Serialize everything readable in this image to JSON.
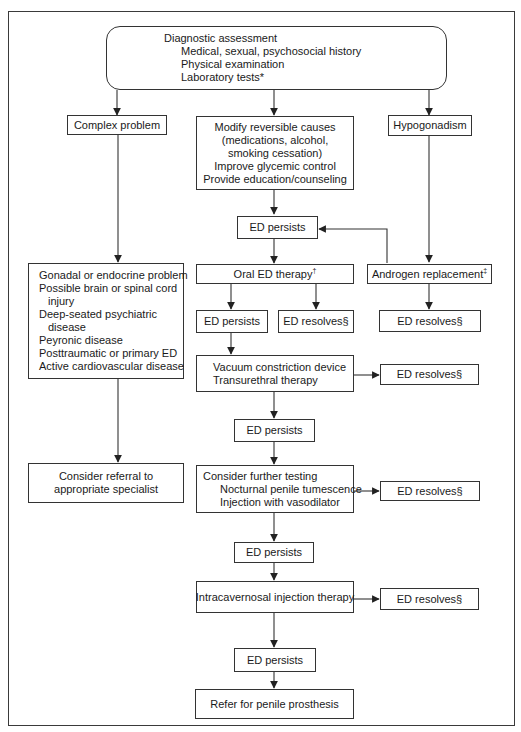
{
  "diagram": {
    "start": {
      "title": "Diagnostic assessment",
      "items": [
        "Medical, sexual, psychosocial history",
        "Physical examination",
        "Laboratory tests*"
      ]
    },
    "complex_problem": "Complex problem",
    "modify_causes": {
      "lines": [
        "Modify reversible causes",
        "(medications, alcohol,",
        "smoking cessation)",
        "Improve glycemic control",
        "Provide education/counseling"
      ]
    },
    "hypogonadism": "Hypogonadism",
    "ed_persists_1": "ED persists",
    "oral_therapy": {
      "label": "Oral ED therapy",
      "mark": "†"
    },
    "androgen": {
      "label": "Androgen replacement",
      "mark": "‡"
    },
    "ed_persists_2": "ED persists",
    "ed_resolves_oral": "ED resolves§",
    "ed_resolves_androgen": "ED resolves§",
    "complex_list": {
      "lines": [
        "Gonadal or endocrine problem",
        "Possible brain or spinal cord",
        "injury",
        "Deep-seated psychiatric",
        "disease",
        "Peyronic disease",
        "Posttraumatic or primary ED",
        "Active cardiovascular disease"
      ]
    },
    "vacuum": {
      "lines": [
        "Vacuum constriction device",
        "Transurethral therapy"
      ]
    },
    "ed_resolves_vacuum": "ED resolves§",
    "ed_persists_3": "ED persists",
    "referral": {
      "lines": [
        "Consider referral to",
        "appropriate specialist"
      ]
    },
    "further_testing": {
      "title": "Consider further testing",
      "items": [
        "Nocturnal penile tumescence",
        "Injection with vasodilator"
      ]
    },
    "ed_resolves_testing": "ED resolves§",
    "ed_persists_4": "ED persists",
    "intracavernosal": "Intracavernosal injection therapy",
    "ed_resolves_intracavernosal": "ED resolves§",
    "ed_persists_5": "ED persists",
    "prosthesis": "Refer for penile prosthesis"
  }
}
